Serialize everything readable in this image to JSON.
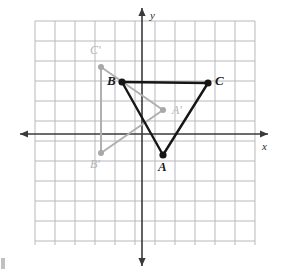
{
  "figure": {
    "background_color": "#ffffff",
    "grid": {
      "color": "#b9b9bd",
      "line_width": 1,
      "cell_size_px": 20,
      "columns": 11,
      "rows": 11,
      "left_px": 35,
      "top_px": 21,
      "right_px": 255,
      "bottom_px": 245
    },
    "axes": {
      "color": "#3a3a3a",
      "line_width": 1.6,
      "x_axis": {
        "label": "x",
        "label_x_px": 262,
        "label_y_px": 141,
        "y_px": 134,
        "from_x_px": 20,
        "to_x_px": 268,
        "arrow_left": true,
        "arrow_right": true
      },
      "y_axis": {
        "label": "y",
        "label_x_px": 150,
        "label_y_px": 10,
        "x_px": 142,
        "from_y_px": 8,
        "to_y_px": 266,
        "arrow_up": true,
        "arrow_down": true
      }
    },
    "preimage": {
      "name": "triangle-abc",
      "stroke_color": "#161616",
      "stroke_width": 2.4,
      "vertex_color": "#161616",
      "vertex_radius_px": 3.6,
      "closed": true,
      "vertices": [
        {
          "id": "A",
          "label": "A",
          "x_px": 163,
          "y_px": 155,
          "label_x_px": 158,
          "label_y_px": 160,
          "grid_x": 1,
          "grid_y": -1
        },
        {
          "id": "B",
          "label": "B",
          "x_px": 122,
          "y_px": 82,
          "label_x_px": 107,
          "label_y_px": 74,
          "grid_x": -1,
          "grid_y": 2.5
        },
        {
          "id": "C",
          "label": "C",
          "x_px": 208,
          "y_px": 83,
          "label_x_px": 215,
          "label_y_px": 74,
          "grid_x": 3.3,
          "grid_y": 2.5
        }
      ]
    },
    "image": {
      "name": "triangle-a-prime-b-prime-c-prime",
      "stroke_color": "#b0b0b0",
      "stroke_width": 2.0,
      "vertex_color": "#a8a8a8",
      "vertex_radius_px": 3.0,
      "closed": true,
      "vertices": [
        {
          "id": "A_prime",
          "label": "A'",
          "x_px": 163,
          "y_px": 110,
          "label_x_px": 172,
          "label_y_px": 104,
          "grid_x": 1,
          "grid_y": 1.2
        },
        {
          "id": "B_prime",
          "label": "B'",
          "x_px": 101,
          "y_px": 153,
          "label_x_px": 90,
          "label_y_px": 158,
          "grid_x": -2,
          "grid_y": -1
        },
        {
          "id": "C_prime",
          "label": "C'",
          "x_px": 101,
          "y_px": 67,
          "label_x_px": 90,
          "label_y_px": 44,
          "grid_x": -2,
          "grid_y": 3.3
        }
      ]
    }
  }
}
